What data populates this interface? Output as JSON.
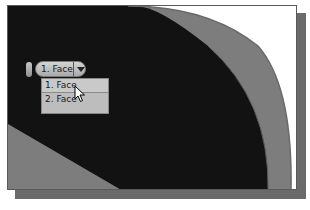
{
  "viewport": {
    "colors": {
      "part_face": "#111111",
      "part_rim": "#7d7d7d",
      "background": "#ffffff",
      "frame_shadow": "#6a6a6a"
    }
  },
  "select_other": {
    "current_label": "1. Face",
    "dropdown_icon": "triangle-down-icon",
    "options": [
      {
        "label": "1. Face",
        "highlighted": true
      },
      {
        "label": "2. Face",
        "highlighted": false
      }
    ]
  },
  "cursor": {
    "icon": "arrow-pointer-icon"
  }
}
